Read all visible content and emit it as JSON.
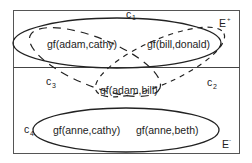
{
  "diagram": {
    "regions": {
      "positive": {
        "label": "E",
        "superscript": "+"
      },
      "negative": {
        "label": "E",
        "superscript": "-"
      }
    },
    "clusters": [
      {
        "id": "c1",
        "label": "c",
        "subscript": "1",
        "style": "solid",
        "members": [
          "gf(adam,cathy)",
          "gf(bill,donald)"
        ]
      },
      {
        "id": "c2",
        "label": "c",
        "subscript": "2",
        "style": "dashed",
        "members": [
          "gf(bill,donald)",
          "gf(adam,bill)"
        ]
      },
      {
        "id": "c3",
        "label": "c",
        "subscript": "3",
        "style": "dashed",
        "members": [
          "gf(adam,cathy)",
          "gf(adam,bill)"
        ]
      },
      {
        "id": "c4",
        "label": "c",
        "subscript": "4",
        "style": "solid",
        "members": [
          "gf(anne,cathy)",
          "gf(anne,beth)"
        ]
      }
    ],
    "facts": {
      "adam_cathy": "gf(adam,cathy)",
      "bill_donald": "gf(bill,donald)",
      "adam_bill": "gf(adam,bill)",
      "anne_cathy": "gf(anne,cathy)",
      "anne_beth": "gf(anne,beth)"
    }
  }
}
